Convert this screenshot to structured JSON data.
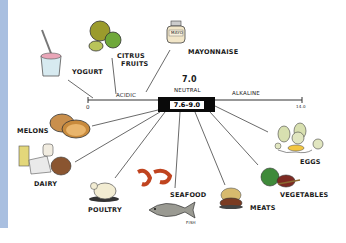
{
  "diagram": {
    "scale": {
      "left_end": "0",
      "right_end": "14.0",
      "center_value": "7.0",
      "center_label": "NEUTRAL",
      "left_label": "ACIDIC",
      "right_label": "ALKALINE",
      "highlight_range": "7.6–9.0"
    },
    "foods": [
      {
        "name": "YOGURT",
        "side": "acidic",
        "icon": "yogurt-cup-icon"
      },
      {
        "name": "CITRUS FRUITS",
        "line1": "CITRUS",
        "line2": "FRUITS",
        "side": "acidic",
        "icon": "citrus-fruits-icon"
      },
      {
        "name": "MAYONNAISE",
        "side": "acidic",
        "icon": "mayo-jar-icon",
        "jar_label": "MAYO"
      },
      {
        "name": "MELONS",
        "icon": "melon-icon"
      },
      {
        "name": "DAIRY",
        "icon": "dairy-icon"
      },
      {
        "name": "POULTRY",
        "icon": "poultry-icon"
      },
      {
        "name": "SEAFOOD",
        "icon": "shrimp-icon",
        "sub_label": "FISH",
        "sub_icon": "fish-icon"
      },
      {
        "name": "MEATS",
        "icon": "meat-icon"
      },
      {
        "name": "VEGETABLES",
        "icon": "vegetables-icon"
      },
      {
        "name": "EGGS",
        "icon": "eggs-icon"
      }
    ],
    "colors": {
      "side_strip": "#a9bfe0",
      "highlight_box": "#0a0a0a",
      "line": "#333333"
    }
  }
}
